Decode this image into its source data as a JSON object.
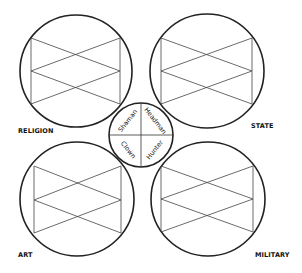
{
  "diagram": {
    "domains": [
      {
        "id": "religion",
        "label": "RELIGION",
        "position": "top-left"
      },
      {
        "id": "state",
        "label": "STATE",
        "position": "top-right"
      },
      {
        "id": "art",
        "label": "ART",
        "position": "bottom-left"
      },
      {
        "id": "military",
        "label": "MILITARY",
        "position": "bottom-right"
      }
    ],
    "center_roles": [
      {
        "id": "shaman",
        "label": "Shaman",
        "quadrant": "top-left"
      },
      {
        "id": "headman",
        "label": "Headman",
        "quadrant": "top-right"
      },
      {
        "id": "clown",
        "label": "Clown",
        "quadrant": "bottom-left"
      },
      {
        "id": "hunter",
        "label": "Hunter",
        "quadrant": "bottom-right"
      }
    ],
    "colors": {
      "stroke": "#222222",
      "background": "#ffffff"
    }
  }
}
